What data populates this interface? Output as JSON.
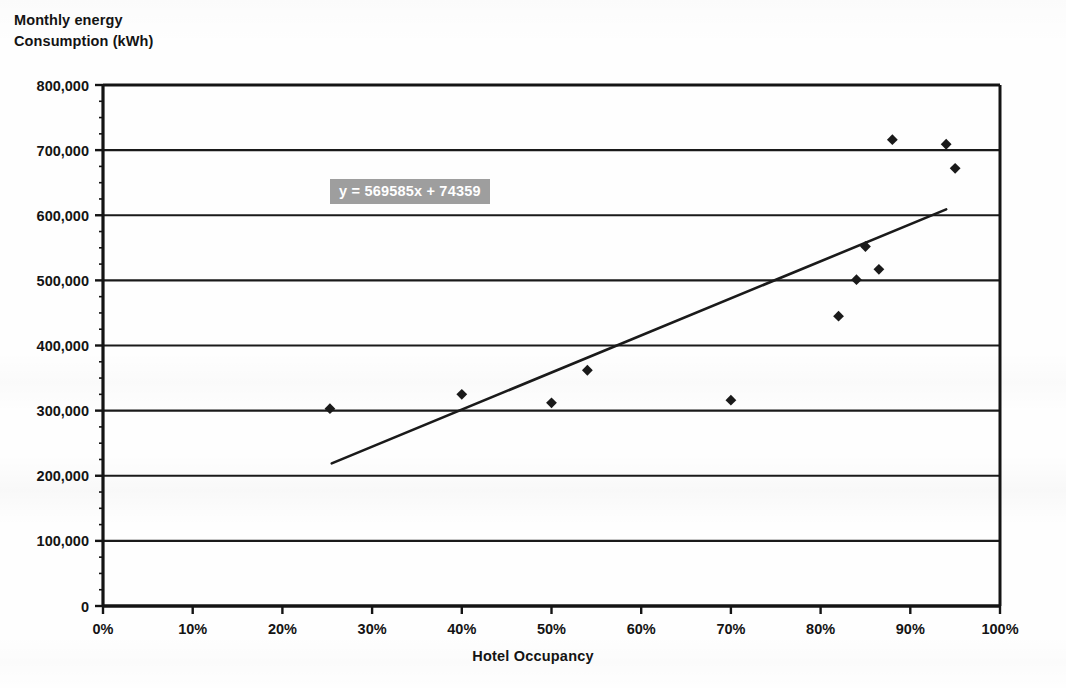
{
  "chart_data": {
    "type": "scatter",
    "title": "",
    "xlabel": "Hotel Occupancy",
    "ylabel": "Monthly energy\nConsumption (kWh)",
    "ylabel_line1": "Monthly energy",
    "ylabel_line2": "Consumption (kWh)",
    "xlim": [
      0,
      100
    ],
    "ylim": [
      0,
      800000
    ],
    "grid": "horizontal",
    "legend": "none",
    "x_unit": "%",
    "x_ticks": [
      0,
      10,
      20,
      30,
      40,
      50,
      60,
      70,
      80,
      90,
      100
    ],
    "x_tick_labels": [
      "0%",
      "10%",
      "20%",
      "30%",
      "40%",
      "50%",
      "60%",
      "70%",
      "80%",
      "90%",
      "100%"
    ],
    "y_ticks": [
      0,
      100000,
      200000,
      300000,
      400000,
      500000,
      600000,
      700000,
      800000
    ],
    "y_tick_labels": [
      "0",
      "100,000",
      "200,000",
      "300,000",
      "400,000",
      "500,000",
      "600,000",
      "700,000",
      "800,000"
    ],
    "series": [
      {
        "name": "Hotel monthly data",
        "marker": "diamond",
        "marker_color": "#1a1a1a",
        "points": [
          {
            "x": 25.3,
            "y": 303000
          },
          {
            "x": 40.0,
            "y": 325000
          },
          {
            "x": 50.0,
            "y": 312000
          },
          {
            "x": 54.0,
            "y": 362000
          },
          {
            "x": 70.0,
            "y": 316000
          },
          {
            "x": 82.0,
            "y": 445000
          },
          {
            "x": 84.0,
            "y": 501000
          },
          {
            "x": 85.0,
            "y": 552000
          },
          {
            "x": 86.5,
            "y": 517000
          },
          {
            "x": 88.0,
            "y": 716000
          },
          {
            "x": 94.0,
            "y": 709000
          },
          {
            "x": 95.0,
            "y": 672000
          }
        ]
      }
    ],
    "trendline": {
      "type": "linear",
      "equation": "y = 569585x + 74359",
      "equation_slope": 569585,
      "equation_intercept": 74359,
      "color": "#1a1a1a",
      "x_start": 25.5,
      "y_start": 219000,
      "x_end": 94.0,
      "y_end": 609000
    },
    "annotations": [
      {
        "text": "y = 569585x + 74359",
        "x_pct": 25.3,
        "y_value": 655000,
        "style": "gray-highlight-white-text"
      }
    ]
  },
  "colors": {
    "marker": "#1a1a1a",
    "trendline": "#1a1a1a",
    "axis": "#141414",
    "gridline": "#1a1a1a",
    "equation_bg": "#9e9e9e",
    "equation_text": "#ffffff",
    "background": "#fefefe"
  },
  "equation": {
    "prefix": "y",
    "full": "y = 569585x + 74359"
  },
  "ghost_artifacts": [
    {
      "text": "scanned bleed-through"
    }
  ]
}
